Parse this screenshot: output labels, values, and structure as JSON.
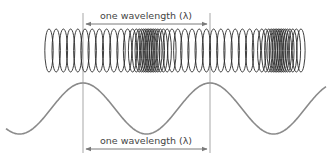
{
  "diagram": {
    "top_label": "one wavelength (λ)",
    "bottom_label": "one wavelength (λ)",
    "colors": {
      "guide_line": "#c8c8c8",
      "arrow": "#7a7a7a",
      "spring": "#2a2a2a",
      "sine_wave": "#8a8a8a",
      "text": "#444444"
    },
    "guide_lines_x": [
      83,
      210
    ],
    "spring": {
      "x_start": 46,
      "x_end": 298,
      "y_top": 29,
      "y_bottom": 72,
      "compressions_x": [
        145,
        275
      ]
    },
    "sine_wave": {
      "peaks_x": [
        83,
        210
      ],
      "troughs_x": [
        147,
        275
      ],
      "y_peak": 83,
      "y_trough": 134
    }
  }
}
